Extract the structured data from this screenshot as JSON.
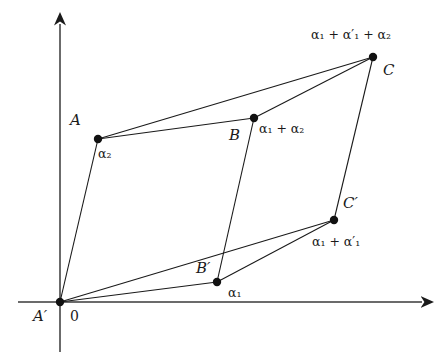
{
  "figure": {
    "background_color": "#ffffff",
    "line_color": "#1a1a1a",
    "text_color": "#1a1a1a",
    "width": 440,
    "height": 364
  },
  "axes": {
    "origin": {
      "x": 60,
      "y": 302
    },
    "x_axis": {
      "from_x": 18,
      "to_x": 428,
      "y": 302,
      "arrow": "right"
    },
    "y_axis": {
      "x": 60,
      "from_y": 352,
      "to_y": 18,
      "arrow": "up"
    },
    "origin_label": "0",
    "origin_point_label": "A′"
  },
  "points": [
    {
      "id": "O",
      "x": 60,
      "y": 302,
      "name": "A′",
      "vector": ""
    },
    {
      "id": "A",
      "x": 98,
      "y": 139,
      "name": "A",
      "vector": "α₂"
    },
    {
      "id": "B",
      "x": 254,
      "y": 118,
      "name": "B",
      "vector": "α₁ + α₂"
    },
    {
      "id": "C",
      "x": 373,
      "y": 57,
      "name": "C",
      "vector": "α₁ + α′₁ + α₂"
    },
    {
      "id": "Bp",
      "x": 217,
      "y": 282,
      "name": "B′",
      "vector": "α₁"
    },
    {
      "id": "Cp",
      "x": 334,
      "y": 220,
      "name": "C′",
      "vector": "α₁ + α′₁"
    }
  ],
  "edges": [
    {
      "from": "O",
      "to": "A"
    },
    {
      "from": "O",
      "to": "Bp"
    },
    {
      "from": "O",
      "to": "Cp"
    },
    {
      "from": "A",
      "to": "B"
    },
    {
      "from": "A",
      "to": "C"
    },
    {
      "from": "B",
      "to": "C"
    },
    {
      "from": "B",
      "to": "Bp"
    },
    {
      "from": "Bp",
      "to": "Cp"
    },
    {
      "from": "Cp",
      "to": "C"
    }
  ],
  "labels": {
    "origin_zero": "0",
    "origin_name": "A′",
    "A_name": "A",
    "A_vector": "α₂",
    "B_name": "B",
    "B_vector": "α₁ + α₂",
    "C_name": "C",
    "C_vector": "α₁ + α′₁ + α₂",
    "Bp_name": "B′",
    "Bp_vector": "α₁",
    "Cp_name": "C′",
    "Cp_vector": "α₁ + α′₁"
  }
}
